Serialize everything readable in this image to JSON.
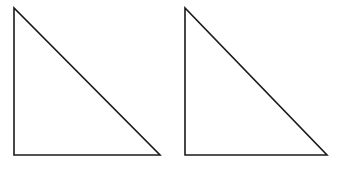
{
  "figure": {
    "width": 343,
    "height": 169,
    "background": "#ffffff",
    "stroke_color": "#1a1a1a",
    "stroke_width": 1.6,
    "shapes": [
      {
        "type": "right-triangle",
        "name": "left-triangle",
        "points": [
          [
            14,
            8
          ],
          [
            14,
            155
          ],
          [
            160,
            155
          ]
        ]
      },
      {
        "type": "right-triangle",
        "name": "right-triangle",
        "points": [
          [
            185,
            8
          ],
          [
            185,
            155
          ],
          [
            327,
            155
          ]
        ]
      }
    ]
  }
}
